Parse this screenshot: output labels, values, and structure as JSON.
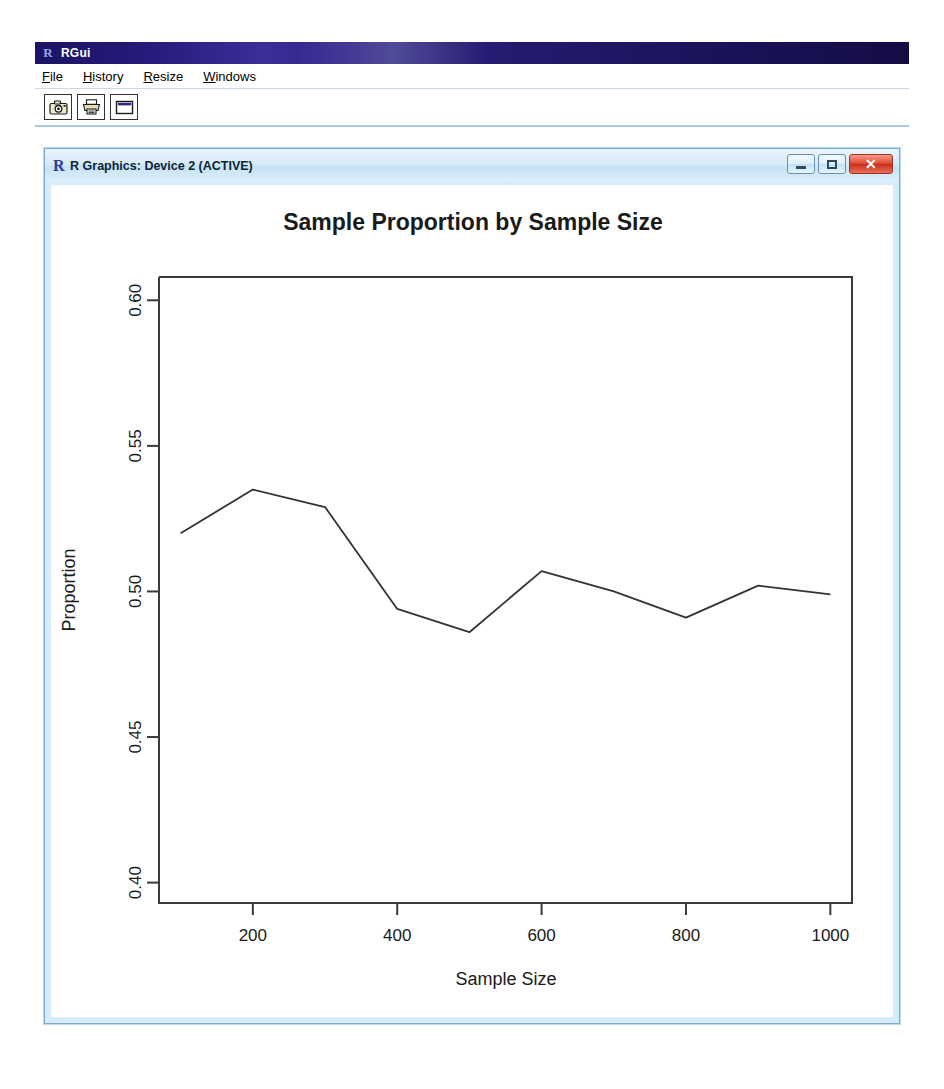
{
  "app": {
    "title": "RGui",
    "icon": "r-logo-icon"
  },
  "menu": {
    "items": [
      {
        "label": "File",
        "accel": "F"
      },
      {
        "label": "History",
        "accel": "H"
      },
      {
        "label": "Resize",
        "accel": "R"
      },
      {
        "label": "Windows",
        "accel": "W"
      }
    ]
  },
  "toolbar": {
    "buttons": [
      {
        "name": "copy-to-clipboard-button",
        "icon": "camera-icon"
      },
      {
        "name": "print-button",
        "icon": "printer-icon"
      },
      {
        "name": "new-device-button",
        "icon": "window-icon"
      }
    ]
  },
  "device_window": {
    "title": "R Graphics: Device 2 (ACTIVE)",
    "icon": "r-logo-icon",
    "controls": [
      {
        "name": "minimize-button",
        "label": "–"
      },
      {
        "name": "maximize-button",
        "label": "□"
      },
      {
        "name": "close-button",
        "label": "✕"
      }
    ]
  },
  "colors": {
    "title_bar_dark_blue": "#1b1464",
    "device_title_light_blue": "#d6ebf8",
    "close_button_red": "#c8301a",
    "plot_line": "#333333",
    "axis": "#3a3a3a",
    "canvas": "#ffffff"
  },
  "chart_data": {
    "type": "line",
    "title": "Sample Proportion by Sample Size",
    "xlabel": "Sample Size",
    "ylabel": "Proportion",
    "x": [
      100,
      200,
      300,
      400,
      500,
      600,
      700,
      800,
      900,
      1000
    ],
    "values": [
      0.52,
      0.535,
      0.529,
      0.494,
      0.486,
      0.507,
      0.5,
      0.491,
      0.502,
      0.499
    ],
    "xlim": [
      70,
      1030
    ],
    "ylim": [
      0.393,
      0.608
    ],
    "xticks": [
      200,
      400,
      600,
      800,
      1000
    ],
    "xtick_labels": [
      "200",
      "400",
      "600",
      "800",
      "1000"
    ],
    "yticks": [
      0.4,
      0.45,
      0.5,
      0.55,
      0.6
    ],
    "ytick_labels": [
      "0.40",
      "0.45",
      "0.50",
      "0.55",
      "0.60"
    ],
    "grid": false,
    "legend": null,
    "ytick_label_rotation": 90
  }
}
